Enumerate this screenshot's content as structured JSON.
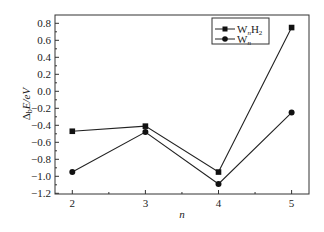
{
  "chart_data": {
    "type": "line",
    "title": "",
    "xlabel": "n",
    "ylabel": "Δ_b E/eV",
    "x": [
      2,
      3,
      4,
      5
    ],
    "xlim": [
      1.75,
      5.25
    ],
    "ylim": [
      -1.2,
      0.85
    ],
    "xticks": [
      "2",
      "3",
      "4",
      "5"
    ],
    "yticks": [
      "0.8",
      "0.6",
      "0.4",
      "0.2",
      "0.0",
      "-0.2",
      "-0.4",
      "-0.6",
      "-0.8",
      "-1.0",
      "-1.2"
    ],
    "grid": false,
    "legend_position": "upper right",
    "series": [
      {
        "name": "WnH2",
        "label_main": "W",
        "label_sub1": "n",
        "label_main2": "H",
        "label_sub2": "2",
        "marker": "square",
        "values": [
          -0.47,
          -0.41,
          -0.95,
          0.75
        ]
      },
      {
        "name": "Wn",
        "label_main": "W",
        "label_sub1": "n",
        "marker": "circle",
        "values": [
          -0.95,
          -0.48,
          -1.09,
          -0.25
        ]
      }
    ]
  },
  "axes": {
    "xlabel": "n",
    "ylabel_delta": "Δ",
    "ylabel_sub": "b",
    "ylabel_rest": "E/eV"
  }
}
